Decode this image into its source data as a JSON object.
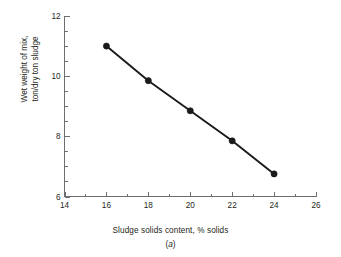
{
  "figure": {
    "caption": "(a)",
    "caption_open": "(",
    "caption_letter": "a",
    "caption_close": ")",
    "background_color": "#ffffff",
    "axis_color": "#6d6e71",
    "data_color": "#1a1a1a"
  },
  "chart_data": {
    "type": "line",
    "title": "",
    "subtitle": "",
    "xlabel": "Sludge solids content, % solids",
    "ylabel_line1": "Wet weight of mix,",
    "ylabel_line2": "ton/dry ton sludge",
    "ylabel": "Wet weight of mix, ton/dry ton sludge",
    "xlim": [
      14,
      26
    ],
    "ylim": [
      6,
      12
    ],
    "x_major_ticks": [
      14,
      16,
      18,
      20,
      22,
      24,
      26
    ],
    "x_major_tick_labels": [
      "14",
      "16",
      "18",
      "20",
      "22",
      "24",
      "26"
    ],
    "x_minor_ticks": [
      15,
      17,
      19,
      21,
      23,
      25
    ],
    "y_major_ticks": [
      6,
      8,
      10,
      12
    ],
    "y_major_tick_labels": [
      "6",
      "8",
      "10",
      "12"
    ],
    "y_minor_ticks": [
      6.5,
      7,
      7.5,
      8.5,
      9,
      9.5,
      10.5,
      11,
      11.5
    ],
    "grid": false,
    "legend": null,
    "marker": "filled-circle",
    "x": [
      16,
      18,
      20,
      22,
      24
    ],
    "values": [
      11.0,
      9.85,
      8.85,
      7.85,
      6.75
    ],
    "series": [
      {
        "name": "Wet weight of mix",
        "x": [
          16,
          18,
          20,
          22,
          24
        ],
        "values": [
          11.0,
          9.85,
          8.85,
          7.85,
          6.75
        ]
      }
    ]
  }
}
